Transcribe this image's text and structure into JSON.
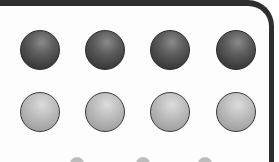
{
  "panel": {
    "border_color": "#2e2e2e",
    "background": "#fdfdfd"
  },
  "rows": [
    {
      "name": "top-row",
      "tone": "dark",
      "count": 4,
      "color": "#4a4a4a",
      "y": 50,
      "x": [
        40,
        105,
        170,
        236
      ]
    },
    {
      "name": "bottom-row",
      "tone": "light",
      "count": 4,
      "color": "#b0b0b0",
      "y": 112,
      "x": [
        40,
        105,
        170,
        236
      ]
    }
  ],
  "partial_shapes_bottom": {
    "count": 3,
    "x": [
      77,
      143,
      205
    ]
  }
}
